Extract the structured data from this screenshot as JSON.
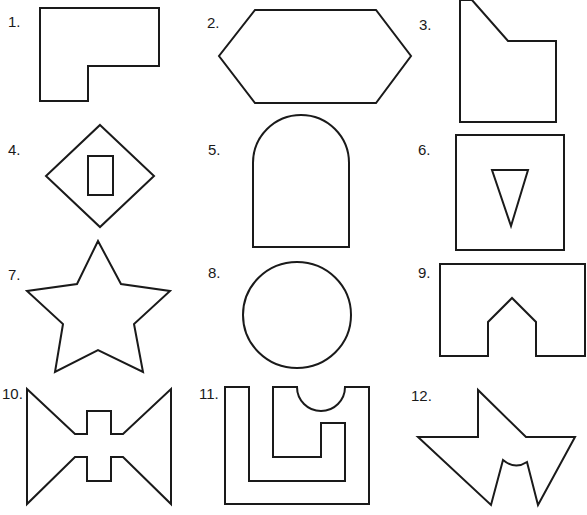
{
  "worksheet": {
    "stroke_color": "#1a1a1a",
    "background": "#ffffff",
    "items": [
      {
        "number": "1.",
        "name": "l-shape",
        "label_x": 8,
        "label_y": 27,
        "paths": [
          "M40 8 L159 8 L159 66 L88 66 L88 101 L40 101 Z"
        ]
      },
      {
        "number": "2.",
        "name": "hexagon",
        "label_x": 207,
        "label_y": 28,
        "paths": [
          "M255 10 L376 10 L411 56 L376 103 L255 103 L219 56 Z"
        ]
      },
      {
        "number": "3.",
        "name": "pentagon-cut-corner",
        "label_x": 419,
        "label_y": 30,
        "paths": [
          "M460 0 L472 0 L508 41 L556 41 L556 122 L460 122 Z"
        ]
      },
      {
        "number": "4.",
        "name": "diamond-with-rectangle",
        "label_x": 8,
        "label_y": 155,
        "paths": [
          "M100 125 L154 176 L100 227 L46 176 Z",
          "M88 156 L113 156 L113 195 L88 195 Z"
        ]
      },
      {
        "number": "5.",
        "name": "arch",
        "label_x": 208,
        "label_y": 155,
        "paths": [
          "M253 247 L253 163 A48 48 0 0 1 349 163 L349 247 Z"
        ]
      },
      {
        "number": "6.",
        "name": "square-with-triangle",
        "label_x": 418,
        "label_y": 155,
        "paths": [
          "M456 135 L564 135 L564 250 L456 250 Z",
          "M492 170 L528 170 L511 226 Z"
        ]
      },
      {
        "number": "7.",
        "name": "star",
        "label_x": 8,
        "label_y": 280,
        "paths": [
          "M98 241 L121 284 L170 291 L134 324 L143 372 L98 350 L55 372 L63 324 L27 291 L77 284 Z"
        ]
      },
      {
        "number": "8.",
        "name": "circle",
        "label_x": 208,
        "label_y": 278,
        "paths": [
          "M243 315 A54 53 0 1 0 351 315 A54 53 0 1 0 243 315 Z"
        ]
      },
      {
        "number": "9.",
        "name": "rectangle-with-house-notch",
        "label_x": 418,
        "label_y": 278,
        "paths": [
          "M440 264 L585 264 L585 356 L536 356 L536 322 L512 298 L488 322 L488 356 L440 356 Z"
        ]
      },
      {
        "number": "10.",
        "name": "bowtie-with-cross",
        "label_x": 2,
        "label_y": 399,
        "paths": [
          "M27 389 L75 434 L87 434 L87 411 L111 411 L111 434 L123 434 L171 389 L171 504 L123 457 L111 457 L111 481 L87 481 L87 457 L75 457 L27 504 Z"
        ]
      },
      {
        "number": "11.",
        "name": "nested-u-shape",
        "label_x": 199,
        "label_y": 399,
        "paths": [
          "M225 387 L249 387 L249 481 L345 481 L345 423 L321 423 L321 457 L273 457 L273 387 L297 387 A24 24 0 0 0 345 387 L369 387 L369 504 L225 504 Z"
        ]
      },
      {
        "number": "12.",
        "name": "angular-bird-shape",
        "label_x": 411,
        "label_y": 401,
        "paths": [
          "M418 437 L478 437 L478 390 L526 437 L575 437 L538 505 L527 462 Q515 470 503 460 L491 505 Z"
        ]
      }
    ]
  }
}
